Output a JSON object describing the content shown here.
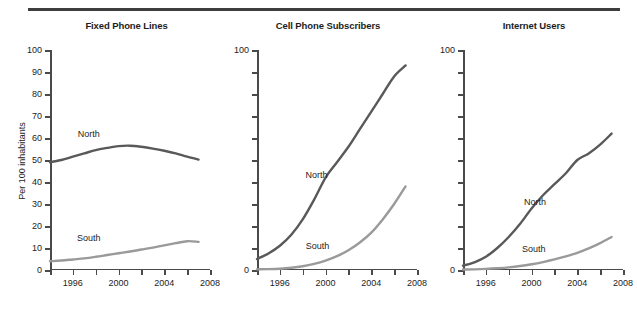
{
  "figure": {
    "ylabel": "Per 100 inhabitants",
    "colors": {
      "north": "#595959",
      "south": "#9a9a9a",
      "axis": "#4a4a4a",
      "text": "#1d1d1d"
    }
  },
  "chart_data": [
    {
      "type": "line",
      "title": "Fixed Phone Lines",
      "xlabel": "",
      "ylabel": "Per 100 inhabitants",
      "xlim": [
        1994,
        2008
      ],
      "ylim": [
        0,
        100
      ],
      "grid": false,
      "legend_position": "inline-annotation",
      "yticks": [
        0,
        10,
        20,
        30,
        40,
        50,
        60,
        70,
        80,
        90,
        100
      ],
      "ytick_labels": [
        "0",
        "10",
        "20",
        "30",
        "40",
        "50",
        "60",
        "70",
        "80",
        "90",
        "100"
      ],
      "xticks": [
        1994,
        1996,
        1998,
        2000,
        2002,
        2004,
        2006,
        2008
      ],
      "xtick_labels": [
        "",
        "1996",
        "",
        "2000",
        "",
        "2004",
        "",
        "2008"
      ],
      "x": [
        1994,
        1995,
        1996,
        1997,
        1998,
        1999,
        2000,
        2001,
        2002,
        2003,
        2004,
        2005,
        2006,
        2007
      ],
      "series": [
        {
          "name": "North",
          "color": "#595959",
          "values": [
            49,
            50,
            51.5,
            53,
            54.5,
            55.5,
            56.3,
            56.5,
            56,
            55.2,
            54.2,
            53,
            51.5,
            50.2
          ],
          "annotation": {
            "text": "North",
            "x": 1997.4,
            "y": 62
          }
        },
        {
          "name": "South",
          "color": "#9a9a9a",
          "values": [
            4,
            4.3,
            4.8,
            5.3,
            6,
            6.8,
            7.6,
            8.4,
            9.3,
            10.2,
            11.2,
            12.2,
            13.1,
            12.8
          ],
          "annotation": {
            "text": "South",
            "x": 1997.4,
            "y": 14.5
          }
        }
      ]
    },
    {
      "type": "line",
      "title": "Cell Phone Subscribers",
      "xlabel": "",
      "ylabel": "",
      "xlim": [
        1994,
        2008
      ],
      "ylim": [
        0,
        100
      ],
      "grid": false,
      "legend_position": "inline-annotation",
      "yticks": [
        0,
        10,
        20,
        30,
        40,
        50,
        60,
        70,
        80,
        90,
        100
      ],
      "ytick_labels": [
        "0",
        "",
        "",
        "",
        "",
        "",
        "",
        "",
        "",
        "",
        "100"
      ],
      "xticks": [
        1994,
        1996,
        1998,
        2000,
        2002,
        2004,
        2006,
        2008
      ],
      "xtick_labels": [
        "",
        "1996",
        "",
        "2000",
        "",
        "2004",
        "",
        "2008"
      ],
      "x": [
        1994,
        1995,
        1996,
        1997,
        1998,
        1999,
        2000,
        2001,
        2002,
        2003,
        2004,
        2005,
        2006,
        2007
      ],
      "series": [
        {
          "name": "North",
          "color": "#595959",
          "values": [
            5,
            7.5,
            11,
            16,
            23,
            32,
            42,
            49,
            56,
            64,
            72,
            80,
            88,
            93
          ],
          "annotation": {
            "text": "North",
            "x": 1999.2,
            "y": 43
          }
        },
        {
          "name": "South",
          "color": "#9a9a9a",
          "values": [
            0.3,
            0.4,
            0.6,
            1,
            1.7,
            2.8,
            4.3,
            6.3,
            9,
            12.5,
            17,
            23,
            30,
            38
          ],
          "annotation": {
            "text": "South",
            "x": 1999.3,
            "y": 11
          }
        }
      ]
    },
    {
      "type": "line",
      "title": "Internet Users",
      "xlabel": "",
      "ylabel": "",
      "xlim": [
        1994,
        2008
      ],
      "ylim": [
        0,
        100
      ],
      "grid": false,
      "legend_position": "inline-annotation",
      "yticks": [
        0,
        10,
        20,
        30,
        40,
        50,
        60,
        70,
        80,
        90,
        100
      ],
      "ytick_labels": [
        "0",
        "",
        "",
        "",
        "",
        "",
        "",
        "",
        "",
        "",
        "100"
      ],
      "xticks": [
        1994,
        1996,
        1998,
        2000,
        2002,
        2004,
        2006,
        2008
      ],
      "xtick_labels": [
        "",
        "1996",
        "",
        "2000",
        "",
        "2004",
        "",
        "2008"
      ],
      "x": [
        1994,
        1995,
        1996,
        1997,
        1998,
        1999,
        2000,
        2001,
        2002,
        2003,
        2004,
        2005,
        2006,
        2007
      ],
      "series": [
        {
          "name": "North",
          "color": "#595959",
          "values": [
            2,
            3.5,
            6,
            10,
            15,
            21,
            28,
            34,
            39,
            44,
            50,
            53,
            57,
            62
          ],
          "annotation": {
            "text": "North",
            "x": 2000.3,
            "y": 31
          }
        },
        {
          "name": "South",
          "color": "#9a9a9a",
          "values": [
            0.2,
            0.3,
            0.5,
            0.8,
            1.2,
            1.8,
            2.6,
            3.6,
            4.8,
            6.2,
            7.8,
            9.8,
            12.2,
            15
          ],
          "annotation": {
            "text": "South",
            "x": 2000.2,
            "y": 9.5
          }
        }
      ]
    }
  ]
}
